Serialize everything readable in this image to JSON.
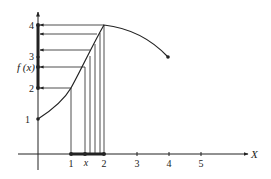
{
  "figure": {
    "x_axis_label": "X",
    "y_axis_label": "f (x)",
    "x_ticks": [
      {
        "label": "1",
        "value": 1
      },
      {
        "label": "x",
        "value": 1.4
      },
      {
        "label": "2",
        "value": 2
      },
      {
        "label": "3",
        "value": 3
      },
      {
        "label": "4",
        "value": 4
      },
      {
        "label": "5",
        "value": 5
      }
    ],
    "y_ticks": [
      {
        "label": "1",
        "value": 1
      },
      {
        "label": "2",
        "value": 2
      },
      {
        "label": "3",
        "value": 3
      },
      {
        "label": "4",
        "value": 4
      }
    ],
    "curve_start": {
      "x": 0,
      "y": 1
    },
    "curve_peak": {
      "x": 2,
      "y": 4
    },
    "curve_end": {
      "x": 4,
      "y": 3
    },
    "highlighted_x_interval": [
      1,
      2
    ],
    "highlighted_y_interval": [
      2,
      4
    ],
    "mapping_lines_x": [
      1,
      1.4,
      1.55,
      1.7,
      1.85,
      2
    ],
    "colors": {
      "ink": "#222222",
      "background": "#ffffff"
    }
  }
}
